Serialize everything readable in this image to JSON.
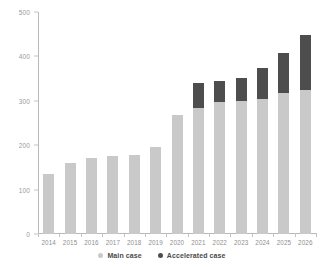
{
  "chart_data": {
    "type": "bar",
    "title": "",
    "subtitle": "",
    "xlabel": "",
    "ylabel": "",
    "stacked": true,
    "grid": false,
    "legend_position": "bottom",
    "ylim": [
      0,
      500
    ],
    "yticks": [
      0,
      100,
      200,
      300,
      400,
      500
    ],
    "ytick_labels": [
      "0",
      "100",
      "200",
      "300",
      "400",
      "500"
    ],
    "categories": [
      "2014",
      "2015",
      "2016",
      "2017",
      "2018",
      "2019",
      "2020",
      "2021",
      "2022",
      "2023",
      "2024",
      "2025",
      "2026"
    ],
    "series": [
      {
        "name": "Main case",
        "color": "#c9c9c9",
        "values": [
          135,
          160,
          172,
          175,
          178,
          195,
          268,
          283,
          298,
          300,
          305,
          318,
          325
        ]
      },
      {
        "name": "Accelerated case",
        "color": "#4d4d4d",
        "values": [
          0,
          0,
          0,
          0,
          0,
          0,
          0,
          57,
          47,
          52,
          70,
          90,
          123
        ]
      }
    ],
    "totals": [
      135,
      160,
      172,
      175,
      178,
      195,
      268,
      340,
      345,
      352,
      375,
      408,
      448
    ]
  },
  "legend": {
    "items": [
      {
        "label": "Main case",
        "marker": "circle-marker-main"
      },
      {
        "label": "Accelerated case",
        "marker": "circle-marker-accelerated"
      }
    ]
  },
  "colors": {
    "main_case": "#c9c9c9",
    "accelerated_case": "#4d4d4d",
    "axis": "#b9b9b9",
    "tick_label": "#9a9a9a",
    "background": "#ffffff"
  }
}
